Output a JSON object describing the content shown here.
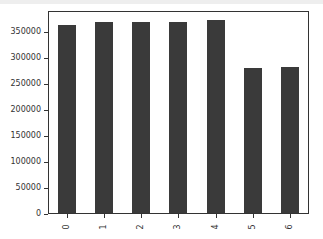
{
  "chart_data": {
    "type": "bar",
    "title": "",
    "xlabel": "",
    "ylabel": "",
    "categories": [
      "0",
      "1",
      "2",
      "3",
      "4",
      "5",
      "6"
    ],
    "values": [
      361000,
      366000,
      366000,
      366000,
      370000,
      278000,
      281000
    ],
    "ylim": [
      0,
      389000
    ],
    "yticks": [
      0,
      50000,
      100000,
      150000,
      200000,
      250000,
      300000,
      350000
    ],
    "ytick_labels": [
      "0",
      "50000",
      "100000",
      "150000",
      "200000",
      "250000",
      "300000",
      "350000"
    ],
    "xtick_rotation": 90,
    "bar_color": "#3a3a3a",
    "grid": false,
    "legend": null
  }
}
